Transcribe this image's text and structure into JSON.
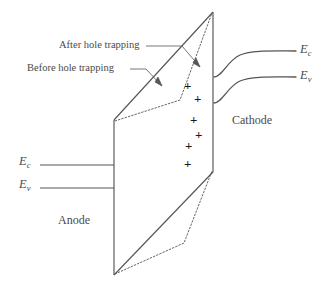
{
  "figure": {
    "stroke_color": "#555555",
    "text_color": "#4a4a4a",
    "charge_color": "#1a1a1a",
    "background": "#ffffff"
  },
  "annotations": {
    "after_hole_trapping": "After hole trapping",
    "before_hole_trapping": "Before hole trapping"
  },
  "electrodes": {
    "anode": "Anode",
    "cathode": "Cathode"
  },
  "bands": {
    "left_conduction": {
      "symbol": "E",
      "subscript": "c"
    },
    "left_valence": {
      "symbol": "E",
      "subscript": "v"
    },
    "right_conduction": {
      "symbol": "E",
      "subscript": "c"
    },
    "right_valence": {
      "symbol": "E",
      "subscript": "v"
    }
  },
  "charges": {
    "symbol": "+",
    "count": 6,
    "positions": [
      {
        "x": 184,
        "y": 79
      },
      {
        "x": 194,
        "y": 92
      },
      {
        "x": 190,
        "y": 113
      },
      {
        "x": 195,
        "y": 128
      },
      {
        "x": 185,
        "y": 139
      },
      {
        "x": 184,
        "y": 157
      }
    ]
  },
  "geometry": {
    "front_face": "M114,120 L213,12 L213,172 L114,275 Z",
    "solid_edges": [
      {
        "name": "top-slant-edge",
        "d": "M114,120 L213,12"
      },
      {
        "name": "left-vertical-edge",
        "d": "M114,120 L114,275"
      },
      {
        "name": "right-vertical-edge",
        "d": "M213,12 L213,172"
      },
      {
        "name": "bottom-slant-edge",
        "d": "M114,275 L213,172"
      }
    ],
    "dotted_edges": [
      {
        "name": "upper-dotted-before-trapping",
        "d": "M115,121 L180,100 L212,13"
      },
      {
        "name": "lower-dotted-before-trapping",
        "d": "M115,274 L184,243 L212,171"
      }
    ],
    "left_band_lines": [
      {
        "name": "left-conduction-line",
        "d": "M40,165 L114,165"
      },
      {
        "name": "left-valence-line",
        "d": "M40,188 L114,188"
      }
    ],
    "right_band_curves": [
      {
        "name": "right-conduction-curve",
        "d": "M214,77 C222,77 228,60 240,55 C252,50 272,51 296,51"
      },
      {
        "name": "right-valence-curve",
        "d": "M214,103 C222,103 228,86 240,81 C252,76 272,77 296,77"
      }
    ],
    "leader_lines": [
      {
        "name": "after-leader",
        "d": "M146,46 L182,46 L200,67"
      },
      {
        "name": "before-leader",
        "d": "M130,69 L146,69 L162,86"
      }
    ],
    "arrow_heads": [
      {
        "name": "after-arrowhead",
        "points": "200,67 193,63 196,58"
      },
      {
        "name": "before-arrowhead",
        "points": "162,86 155,82 158,77"
      }
    ]
  }
}
